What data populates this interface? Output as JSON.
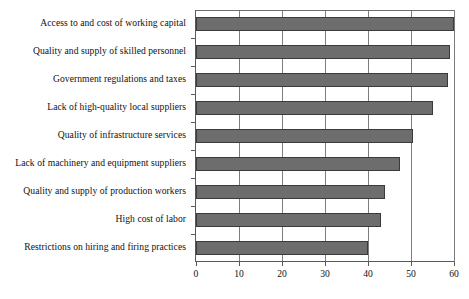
{
  "chart_data": {
    "type": "bar",
    "orientation": "horizontal",
    "title": "",
    "subtitle": "",
    "xlabel": "",
    "ylabel": "",
    "xlim": [
      0,
      60
    ],
    "ylim": null,
    "grid": true,
    "legend": null,
    "xticks": [
      0,
      10,
      20,
      30,
      40,
      50,
      60
    ],
    "xticklabels": [
      "0",
      "10",
      "20",
      "30",
      "40",
      "50",
      "60"
    ],
    "categories": [
      "Access to and cost of working capital",
      "Quality and supply of skilled personnel",
      "Government regulations and taxes",
      "Lack of high-quality local suppliers",
      "Quality of infrastructure services",
      "Lack of machinery and equipment suppliers",
      "Quality and supply of production workers",
      "High cost of labor",
      "Restrictions on hiring and firing practices"
    ],
    "values": [
      60,
      59,
      58.5,
      55,
      50.5,
      47.5,
      44,
      43,
      40
    ],
    "bar_color": "#6d6d6d",
    "bar_edge_color": "#3a3a3a",
    "axis_color": "#5a5a5a",
    "grid_color": "#7d7d7d",
    "background_color": "#ffffff"
  }
}
